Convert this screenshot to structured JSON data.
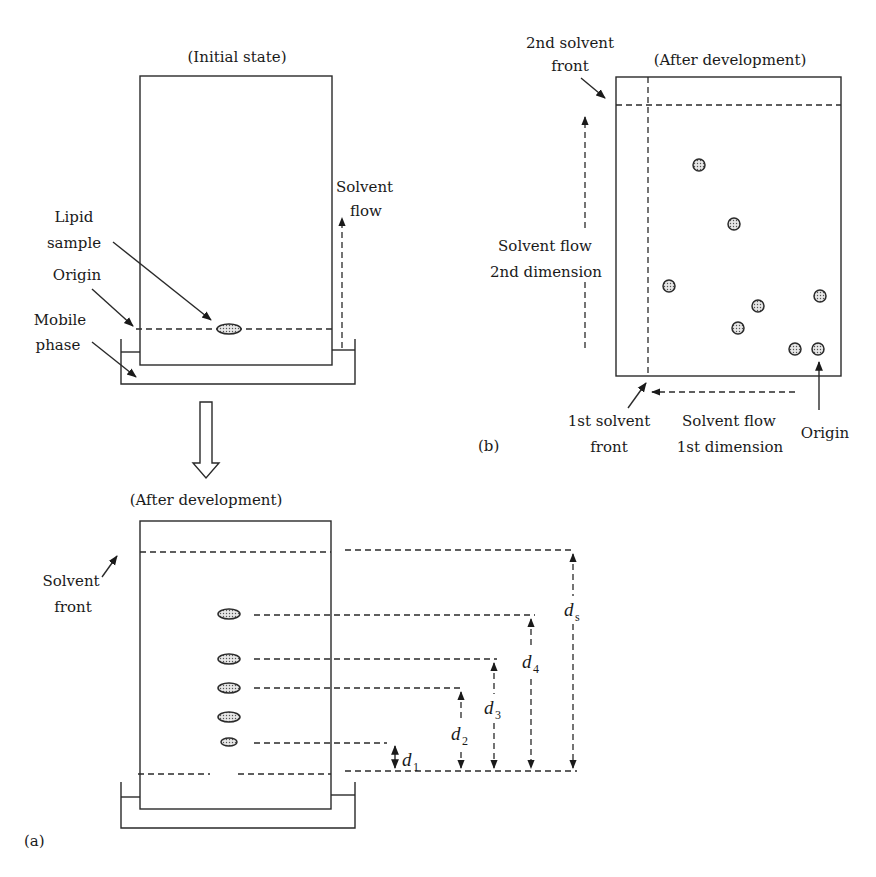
{
  "panel_a": {
    "label": "(a)",
    "initial": {
      "title": "(Initial state)",
      "lipid_sample": [
        "Lipid",
        "sample"
      ],
      "origin": "Origin",
      "mobile_phase": [
        "Mobile",
        "phase"
      ],
      "solvent_flow": [
        "Solvent",
        "flow"
      ]
    },
    "developed": {
      "title": "(After development)",
      "solvent_front": [
        "Solvent",
        "front"
      ],
      "spot_count": 5,
      "distances": [
        {
          "symbol": "d",
          "sub": "1"
        },
        {
          "symbol": "d",
          "sub": "2"
        },
        {
          "symbol": "d",
          "sub": "3"
        },
        {
          "symbol": "d",
          "sub": "4"
        },
        {
          "symbol": "d",
          "sub": "s"
        }
      ]
    }
  },
  "panel_b": {
    "label": "(b)",
    "title": "(After development)",
    "second_front": [
      "2nd solvent",
      "front"
    ],
    "flow_2nd": [
      "Solvent flow",
      "2nd dimension"
    ],
    "first_front": [
      "1st solvent",
      "front"
    ],
    "flow_1st": [
      "Solvent flow",
      "1st dimension"
    ],
    "origin": "Origin",
    "spot_count": 8
  }
}
